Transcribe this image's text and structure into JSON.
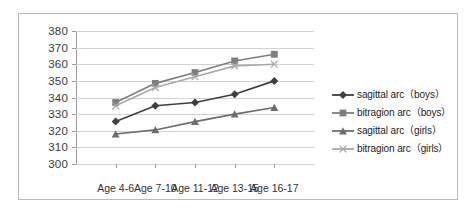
{
  "chart_data": {
    "type": "line",
    "title": "",
    "xlabel": "",
    "ylabel": "",
    "categories": [
      "Age 4-6",
      "Age 7-10",
      "Age 11-12",
      "Age 13-15",
      "Age 16-17"
    ],
    "ylim": [
      300,
      380
    ],
    "yticks": [
      300,
      310,
      320,
      330,
      340,
      350,
      360,
      370,
      380
    ],
    "grid": true,
    "legend_position": "right",
    "series": [
      {
        "name": "sagittal arc（boys）",
        "marker": "diamond",
        "color": "#3f3f3f",
        "values": [
          325.5,
          335,
          337,
          342,
          350
        ]
      },
      {
        "name": "bitragion arc（boys）",
        "marker": "square",
        "color": "#7d7d7d",
        "values": [
          337,
          348.5,
          355,
          362,
          366
        ]
      },
      {
        "name": "sagittal arc（girls）",
        "marker": "triangle",
        "color": "#6e6e6e",
        "values": [
          318,
          320.5,
          325.5,
          330,
          334
        ]
      },
      {
        "name": "bitragion arc（girls）",
        "marker": "x",
        "color": "#a8a8a8",
        "values": [
          335,
          346,
          352.5,
          359,
          360
        ]
      }
    ]
  },
  "legend": {
    "items": [
      {
        "label": "sagittal arc（boys）"
      },
      {
        "label": "bitragion arc（boys）"
      },
      {
        "label": "sagittal arc（girls）"
      },
      {
        "label": "bitragion arc（girls）"
      }
    ]
  },
  "axis": {
    "y_labels": [
      "380",
      "370",
      "360",
      "350",
      "340",
      "330",
      "320",
      "310",
      "300"
    ],
    "x_labels": [
      "Age 4-6",
      "Age 7-10",
      "Age 11-12",
      "Age 13-15",
      "Age 16-17"
    ]
  },
  "colors": {
    "grid": "#d2d2d2",
    "axis": "#9a9a9a",
    "frame": "#b9b9b9",
    "background": "#ffffff"
  }
}
